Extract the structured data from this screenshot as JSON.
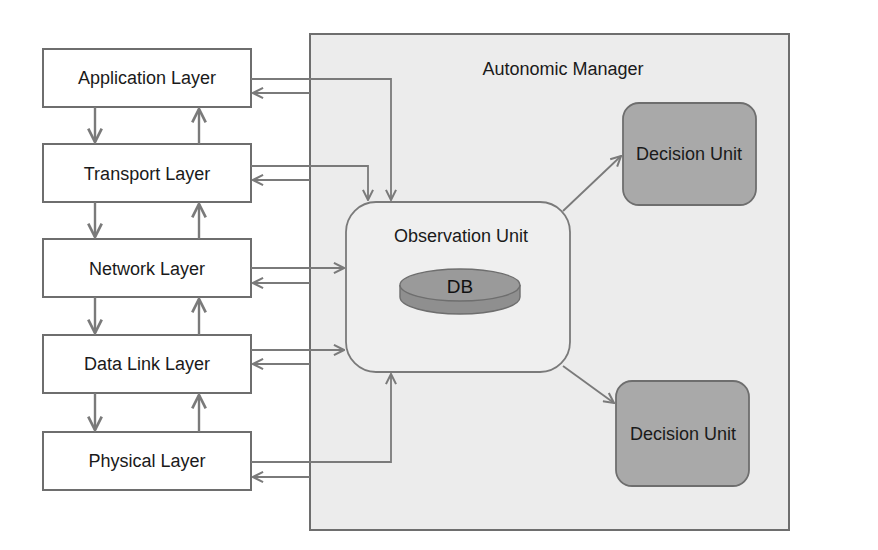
{
  "diagram": {
    "layers": [
      {
        "id": "application",
        "label": "Application Layer"
      },
      {
        "id": "transport",
        "label": "Transport Layer"
      },
      {
        "id": "network",
        "label": "Network Layer"
      },
      {
        "id": "data-link",
        "label": "Data Link Layer"
      },
      {
        "id": "physical",
        "label": "Physical Layer"
      }
    ],
    "manager": {
      "title": "Autonomic Manager",
      "observation_unit": {
        "label": "Observation Unit",
        "db_label": "DB"
      },
      "decision_units": [
        {
          "label": "Decision Unit"
        },
        {
          "label": "Decision Unit"
        }
      ]
    },
    "colors": {
      "line": "#7a7a7a",
      "manager_fill": "#ececec",
      "decision_fill": "#a9a9a9",
      "db_fill": "#8f8f8f",
      "box_fill": "#ffffff"
    }
  }
}
